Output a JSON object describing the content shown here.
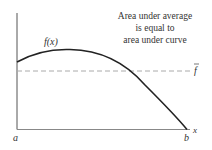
{
  "figure": {
    "annotation": [
      "Area under average",
      "is equal to",
      "area under curve"
    ],
    "curve_label": "f(x)",
    "average_label": "f",
    "x_axis_label": "x",
    "left_bound_label": "a",
    "right_bound_label": "b"
  },
  "colors": {
    "curve": "#222222",
    "axis": "#555555",
    "average_line": "#aaaaaa",
    "text": "#333333"
  }
}
